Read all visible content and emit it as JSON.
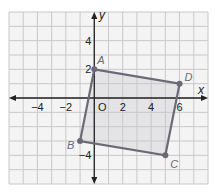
{
  "graph": {
    "grid": {
      "xmin": -6,
      "xmax": 8,
      "ymin": -6,
      "ymax": 6,
      "step": 1
    },
    "axes": {
      "x_label": "x",
      "y_label": "y",
      "origin_label": "O"
    },
    "x_ticks": [
      {
        "value": -4,
        "label": "−4"
      },
      {
        "value": -2,
        "label": "−2"
      },
      {
        "value": 2,
        "label": "2"
      },
      {
        "value": 4,
        "label": "4"
      },
      {
        "value": 6,
        "label": "6"
      }
    ],
    "y_ticks": [
      {
        "value": 4,
        "label": "4"
      },
      {
        "value": 2,
        "label": "2"
      },
      {
        "value": -4,
        "label": "−4"
      }
    ],
    "quadrilateral": {
      "vertices": [
        {
          "name": "A",
          "x": 0,
          "y": 2
        },
        {
          "name": "D",
          "x": 6,
          "y": 1
        },
        {
          "name": "C",
          "x": 5,
          "y": -4
        },
        {
          "name": "B",
          "x": -1,
          "y": -3
        }
      ],
      "stroke_color": "#6b6b78",
      "fill_color": "#e4e4e6"
    },
    "colors": {
      "grid_line": "#c8c8c8",
      "grid_bg": "#f4f4f4",
      "axis": "#222222"
    }
  }
}
